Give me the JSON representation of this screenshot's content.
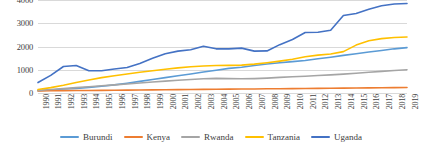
{
  "chart_data": {
    "type": "line",
    "title": "",
    "xlabel": "",
    "ylabel": "",
    "ylim": [
      0,
      4000
    ],
    "yticks": [
      0,
      1000,
      2000,
      3000,
      4000
    ],
    "grid": true,
    "legend_position": "bottom",
    "x": [
      1990,
      1991,
      1992,
      1993,
      1994,
      1995,
      1996,
      1997,
      1998,
      1999,
      2000,
      2001,
      2002,
      2003,
      2004,
      2005,
      2006,
      2007,
      2008,
      2009,
      2010,
      2011,
      2012,
      2013,
      2014,
      2015,
      2016,
      2017,
      2018,
      2019
    ],
    "series": [
      {
        "name": "Burundi",
        "color": "#5B9BD5",
        "values": [
          100,
          130,
          170,
          200,
          240,
          290,
          350,
          420,
          500,
          580,
          660,
          740,
          820,
          900,
          980,
          1060,
          1110,
          1180,
          1250,
          1300,
          1350,
          1400,
          1470,
          1540,
          1620,
          1690,
          1760,
          1830,
          1900,
          1950
        ]
      },
      {
        "name": "Kenya",
        "color": "#ED7D31",
        "values": [
          90,
          95,
          100,
          105,
          110,
          115,
          120,
          125,
          130,
          135,
          140,
          145,
          150,
          155,
          160,
          165,
          170,
          175,
          180,
          185,
          190,
          195,
          200,
          205,
          210,
          215,
          220,
          225,
          230,
          235
        ]
      },
      {
        "name": "Rwanda",
        "color": "#A5A5A5",
        "values": [
          110,
          150,
          190,
          230,
          270,
          310,
          350,
          390,
          430,
          470,
          510,
          550,
          580,
          610,
          630,
          620,
          610,
          620,
          640,
          670,
          700,
          720,
          750,
          780,
          810,
          850,
          890,
          930,
          970,
          1000
        ]
      },
      {
        "name": "Tanzania",
        "color": "#FFC000",
        "values": [
          150,
          230,
          330,
          450,
          560,
          660,
          740,
          820,
          890,
          960,
          1020,
          1080,
          1130,
          1160,
          1180,
          1190,
          1200,
          1240,
          1300,
          1370,
          1450,
          1560,
          1630,
          1680,
          1780,
          2060,
          2250,
          2340,
          2390,
          2410
        ]
      },
      {
        "name": "Uganda",
        "color": "#4472C4",
        "values": [
          450,
          760,
          1140,
          1180,
          960,
          960,
          1030,
          1100,
          1270,
          1490,
          1690,
          1800,
          1860,
          2010,
          1900,
          1900,
          1930,
          1800,
          1810,
          2080,
          2300,
          2600,
          2610,
          2700,
          3330,
          3420,
          3600,
          3750,
          3830,
          3850
        ]
      }
    ]
  },
  "axes": {
    "y_tick_labels": [
      "4000",
      "3000",
      "2000",
      "1000",
      "0"
    ],
    "x_tick_labels": [
      "1990",
      "1991",
      "1992",
      "1993",
      "1994",
      "1995",
      "1996",
      "1997",
      "1998",
      "1999",
      "2000",
      "2001",
      "2002",
      "2003",
      "2004",
      "2005",
      "2006",
      "2007",
      "2008",
      "2009",
      "2010",
      "2011",
      "2012",
      "2013",
      "2014",
      "2015",
      "2016",
      "2017",
      "2018",
      "2019"
    ]
  },
  "legend": {
    "items": [
      {
        "label": "Burundi",
        "color": "#5B9BD5"
      },
      {
        "label": "Kenya",
        "color": "#ED7D31"
      },
      {
        "label": "Rwanda",
        "color": "#A5A5A5"
      },
      {
        "label": "Tanzania",
        "color": "#FFC000"
      },
      {
        "label": "Uganda",
        "color": "#4472C4"
      }
    ]
  }
}
